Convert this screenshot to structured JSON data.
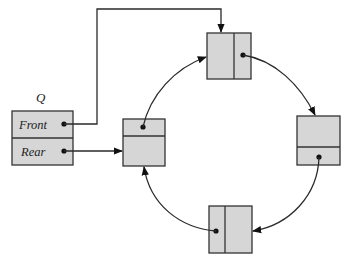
{
  "diagram": {
    "type": "circular-linked-queue",
    "queue": {
      "name": "Q",
      "fields": [
        {
          "label": "Front",
          "points_to": "top-node"
        },
        {
          "label": "Rear",
          "points_to": "left-node"
        }
      ]
    },
    "nodes": [
      {
        "id": "top-node",
        "next": "right-node"
      },
      {
        "id": "right-node",
        "next": "bottom-node"
      },
      {
        "id": "bottom-node",
        "next": "left-node"
      },
      {
        "id": "left-node",
        "next": "top-node"
      }
    ],
    "colors": {
      "node_fill": "#d6d6d6",
      "stroke": "#333333",
      "background": "#ffffff"
    }
  }
}
